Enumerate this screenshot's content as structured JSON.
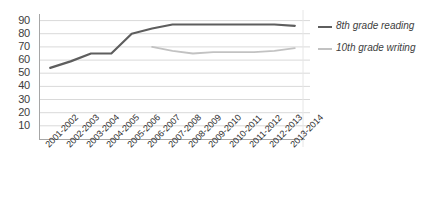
{
  "chart_data": {
    "type": "line",
    "title": "",
    "subtitle": "",
    "xlabel": "",
    "ylabel": "",
    "ylim": [
      0,
      95
    ],
    "yticks": [
      90,
      80,
      70,
      60,
      50,
      40,
      30,
      20,
      10
    ],
    "grid": true,
    "legend_position": "right",
    "categories": [
      "2001-2002",
      "2002-2003",
      "2003-2004",
      "2004-2005",
      "2005-2006",
      "2006-2007",
      "2007-2008",
      "2008-2009",
      "2009-2010",
      "2010-2011",
      "2011-2012",
      "2012-2013",
      "2013-2014"
    ],
    "series": [
      {
        "name": "8th grade reading",
        "color": "#5e5e5e",
        "values": [
          54,
          59,
          65,
          65,
          80,
          84,
          87,
          87,
          87,
          87,
          87,
          87,
          86
        ]
      },
      {
        "name": "10th grade writing",
        "color": "#c2c2c2",
        "values": [
          null,
          null,
          null,
          null,
          null,
          70,
          67,
          65,
          66,
          66,
          66,
          67,
          69
        ]
      }
    ]
  },
  "legend": {
    "items": [
      {
        "label": "8th grade reading",
        "color": "#5e5e5e"
      },
      {
        "label": "10th grade writing",
        "color": "#c2c2c2"
      }
    ]
  },
  "axes": {
    "y_tick_labels": [
      "90",
      "80",
      "70",
      "60",
      "50",
      "40",
      "30",
      "20",
      "10"
    ],
    "x_tick_labels": [
      "2001-2002",
      "2002-2003",
      "2003-2004",
      "2004-2005",
      "2005-2006",
      "2006-2007",
      "2007-2008",
      "2008-2009",
      "2009-2010",
      "2010-2011",
      "2011-2012",
      "2012-2013",
      "2013-2014"
    ]
  },
  "colors": {
    "series_reading": "#5e5e5e",
    "series_writing": "#c2c2c2",
    "gridline": "#d9d9d9",
    "axis": "#a6a6a6",
    "background": "#ffffff",
    "text": "#3d3d3d"
  }
}
